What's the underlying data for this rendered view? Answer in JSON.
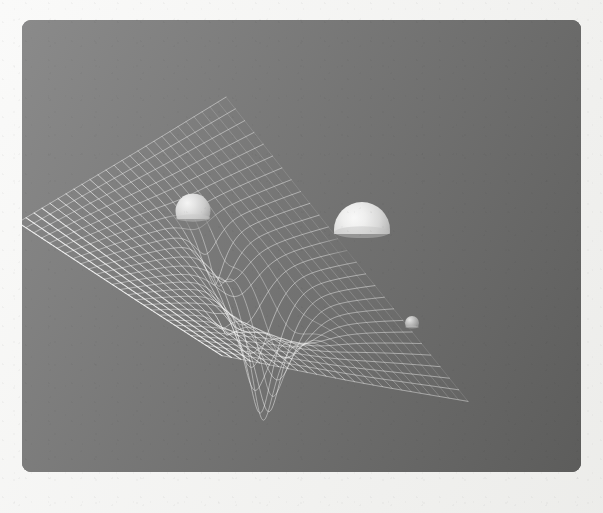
{
  "frame": {
    "mount_color": "#f4f4f2",
    "panel_color": "#000000",
    "panel_radius_px": 9,
    "width_px": 603,
    "height_px": 513,
    "panel_left_px": 22,
    "panel_top_px": 20,
    "panel_width_px": 559,
    "panel_height_px": 452
  },
  "scene": {
    "title": "Spacetime Curvature",
    "subject": "gravity-well-grid",
    "background_color": "#000000",
    "grid_color": "#ffffff",
    "light_direction": "upper-left",
    "caption": ""
  },
  "chart_data": {
    "type": "heatmap",
    "xlabel": "",
    "ylabel": "",
    "grid": true,
    "legend": "none",
    "surface": {
      "mesh_lines_u": 27,
      "mesh_lines_v": 27,
      "domain_u": [
        -1,
        1
      ],
      "domain_v": [
        -1,
        1
      ],
      "projection": "oblique-perspective",
      "camera_pitch_deg": 28,
      "camera_yaw_deg": -22,
      "line_width_px": 0.85,
      "line_opacity_far": 0.22,
      "line_opacity_near": 0.92
    },
    "quad_corners_px": {
      "back": [
        226,
        96
      ],
      "left": [
        18,
        222
      ],
      "front": [
        222,
        355
      ],
      "right": [
        468,
        400
      ]
    },
    "masses": [
      {
        "name": "medium-mass-sphere",
        "label": "Medium mass",
        "u": -0.3,
        "v": 0.14,
        "cx_px": 193,
        "cy_px": 211,
        "radius_px": 17.5,
        "well_depth": 0.36,
        "well_sigma": 0.115,
        "sink_fraction": 0.3,
        "albedo": "#c9c9c9",
        "highlight": "#efefef"
      },
      {
        "name": "large-mass-sphere",
        "label": "Large mass",
        "u": 0.18,
        "v": 0.08,
        "cx_px": 362,
        "cy_px": 230,
        "radius_px": 28.0,
        "well_depth": 1.0,
        "well_sigma": 0.175,
        "sink_fraction": 0.46,
        "albedo": "#d8d8d8",
        "highlight": "#f7f7f7"
      },
      {
        "name": "small-mass-sphere",
        "label": "Small mass",
        "u": 0.42,
        "v": -0.46,
        "cx_px": 412,
        "cy_px": 323,
        "radius_px": 7.0,
        "well_depth": 0.14,
        "well_sigma": 0.075,
        "sink_fraction": 0.22,
        "albedo": "#8f8f8f",
        "highlight": "#cfcfcf"
      }
    ]
  }
}
